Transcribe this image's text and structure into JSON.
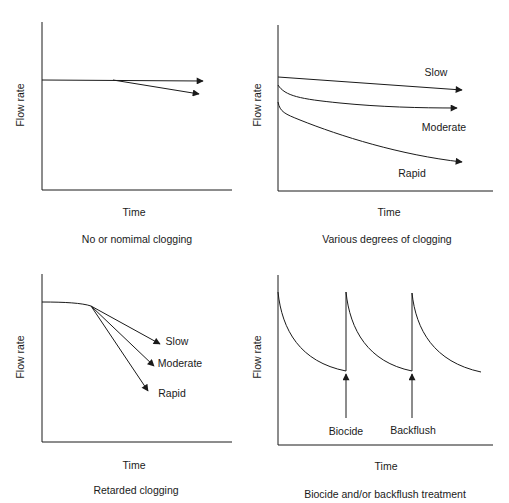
{
  "panels": [
    {
      "id": "no-clogging",
      "ylabel": "Flow rate",
      "xlabel": "Time",
      "caption": "No or nomimal clogging",
      "curve_labels": []
    },
    {
      "id": "various-clogging",
      "ylabel": "Flow rate",
      "xlabel": "Time",
      "caption": "Various degrees of clogging",
      "curve_labels": [
        "Slow",
        "Moderate",
        "Rapid"
      ]
    },
    {
      "id": "retarded-clogging",
      "ylabel": "Flow rate",
      "xlabel": "Time",
      "caption": "Retarded clogging",
      "curve_labels": [
        "Slow",
        "Moderate",
        "Rapid"
      ]
    },
    {
      "id": "biocide-backflush",
      "ylabel": "Flow rate",
      "xlabel": "Time",
      "caption": "Biocide and/or backflush treatment",
      "curve_labels": [
        "Biocide",
        "Backflush"
      ]
    }
  ],
  "colors": {
    "ink": "#1a1a1a",
    "background": "#ffffff"
  }
}
